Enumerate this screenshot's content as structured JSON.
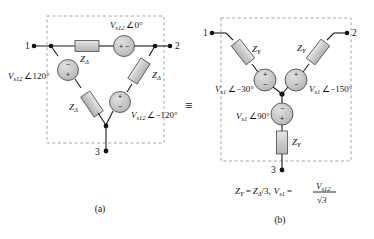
{
  "figure": {
    "equivalence_symbol": "≡",
    "panel_a": {
      "caption": "(a)",
      "type": "delta-connected-source",
      "terminals": [
        {
          "name": "1",
          "label": "1"
        },
        {
          "name": "2",
          "label": "2"
        },
        {
          "name": "3",
          "label": "3"
        }
      ],
      "impedances": [
        {
          "label_base": "Z",
          "label_sub": "Δ",
          "position": "top"
        },
        {
          "label_base": "Z",
          "label_sub": "Δ",
          "position": "right"
        },
        {
          "label_base": "Z",
          "label_sub": "Δ",
          "position": "left"
        }
      ],
      "sources": [
        {
          "base": "V",
          "sub": "s12",
          "angle_symbol": "∠",
          "angle": "0°",
          "position": "top",
          "plus_side": "left",
          "minus_side": "right"
        },
        {
          "base": "V",
          "sub": "s12",
          "angle_symbol": "∠",
          "angle": "120°",
          "position": "left",
          "plus_side": "bottom",
          "minus_side": "top"
        },
        {
          "base": "V",
          "sub": "s12",
          "angle_symbol": "∠",
          "angle": "−120°",
          "position": "right",
          "plus_side": "top",
          "minus_side": "bottom"
        }
      ]
    },
    "panel_b": {
      "caption": "(b)",
      "type": "wye-connected-source",
      "terminals": [
        {
          "name": "1",
          "label": "1"
        },
        {
          "name": "2",
          "label": "2"
        },
        {
          "name": "3",
          "label": "3"
        }
      ],
      "impedances": [
        {
          "label_base": "Z",
          "label_sub": "Y",
          "position": "upper-left"
        },
        {
          "label_base": "Z",
          "label_sub": "Y",
          "position": "upper-right"
        },
        {
          "label_base": "Z",
          "label_sub": "Y",
          "position": "bottom"
        }
      ],
      "sources": [
        {
          "base": "V",
          "sub": "s1",
          "angle_symbol": "∠",
          "angle": "−30°",
          "position": "left-branch",
          "plus_side": "top",
          "minus_side": "bottom"
        },
        {
          "base": "V",
          "sub": "s1",
          "angle_symbol": "∠",
          "angle": "−150°",
          "position": "right-branch",
          "plus_side": "top",
          "minus_side": "bottom"
        },
        {
          "base": "V",
          "sub": "s1",
          "angle_symbol": "∠",
          "angle": "90°",
          "position": "bottom-branch",
          "plus_side": "bottom",
          "minus_side": "top"
        }
      ],
      "equation": {
        "z_lhs_base": "Z",
        "z_lhs_sub": "Y",
        "equals": "=",
        "z_rhs_base": "Z",
        "z_rhs_sub": "Δ",
        "z_rhs_div": "/3,",
        "v_lhs_base": "V",
        "v_lhs_sub": "s1",
        "v_equals": "=",
        "frac_num_base": "V",
        "frac_num_sub": "s12",
        "frac_den": "√3"
      }
    }
  },
  "style": {
    "wire_color": "#1a1a1a",
    "element_fill": "#c9c9c9",
    "element_stroke": "#4a4a4a",
    "dash_box_color": "#9a9aa8",
    "text_color": "#111111",
    "background": "#ffffff"
  }
}
